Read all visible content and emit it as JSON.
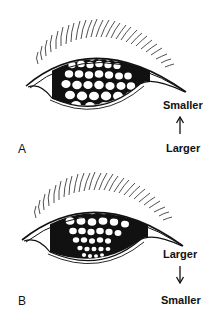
{
  "figure": {
    "panels": [
      {
        "id": "A",
        "letter": "A",
        "top_label": "Smaller",
        "bottom_label": "Larger",
        "arrow_direction": "up",
        "spot_gradient": "small-at-top, large-at-bottom"
      },
      {
        "id": "B",
        "letter": "B",
        "top_label": "Larger",
        "bottom_label": "Smaller",
        "arrow_direction": "down",
        "spot_gradient": "large-at-top, small-at-bottom"
      }
    ],
    "colors": {
      "ink": "#111111",
      "background": "#ffffff"
    }
  }
}
